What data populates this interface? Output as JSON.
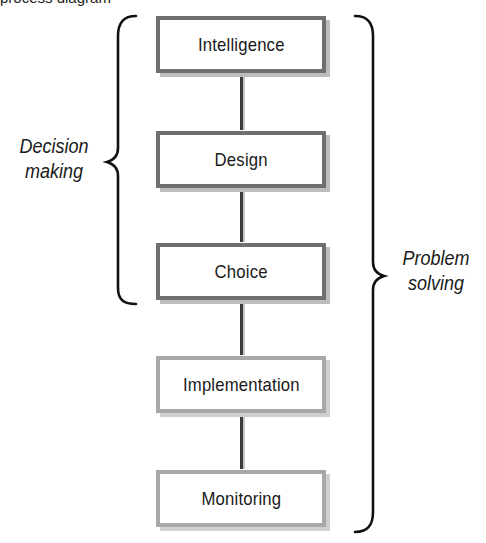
{
  "diagram": {
    "type": "process-flow",
    "top_cut_text": "process diagram",
    "stages": [
      {
        "label": "Intelligence",
        "group": "decision-making"
      },
      {
        "label": "Design",
        "group": "decision-making"
      },
      {
        "label": "Choice",
        "group": "decision-making"
      },
      {
        "label": "Implementation",
        "group": "problem-solving-only"
      },
      {
        "label": "Monitoring",
        "group": "problem-solving-only"
      }
    ],
    "groups": {
      "decision_making": {
        "line1": "Decision",
        "line2": "making",
        "spans": [
          "Intelligence",
          "Design",
          "Choice"
        ]
      },
      "problem_solving": {
        "line1": "Problem",
        "line2": "solving",
        "spans": [
          "Intelligence",
          "Design",
          "Choice",
          "Implementation",
          "Monitoring"
        ]
      }
    },
    "colors": {
      "decision_box_border": "#6f6f6f",
      "problem_box_border": "#a8a8a8",
      "brace": "#111111",
      "connector": "#3a3a3a"
    }
  }
}
